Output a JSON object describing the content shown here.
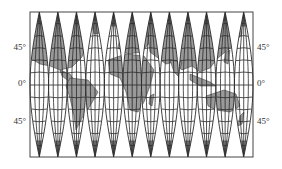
{
  "map": {
    "type": "interrupted-gore-projection",
    "gore_count": 12,
    "frame": {
      "x": 30,
      "y": 12,
      "width": 223,
      "height": 145
    },
    "equator_y": 85,
    "colors": {
      "land": "#9a9a9a",
      "ocean": "#ffffff",
      "graticule": "#2a2a2a",
      "frame": "#444444",
      "label": "#333333"
    },
    "labels": {
      "left": [
        {
          "text": "45°",
          "y": 42
        },
        {
          "text": "0°",
          "y": 78
        },
        {
          "text": "45°",
          "y": 116
        }
      ],
      "right": [
        {
          "text": "45°",
          "y": 42
        },
        {
          "text": "0°",
          "y": 78
        },
        {
          "text": "45°",
          "y": 116
        }
      ]
    }
  }
}
